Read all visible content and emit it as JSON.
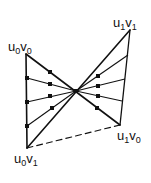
{
  "diagram": {
    "stroke_color": "#111111",
    "vertices": {
      "u0v0": {
        "x": 26,
        "y": 54
      },
      "u0v1": {
        "x": 27,
        "y": 148
      },
      "u1v1": {
        "x": 130,
        "y": 30
      },
      "u1v0": {
        "x": 120,
        "y": 125
      },
      "center": {
        "x": 76,
        "y": 91
      }
    },
    "labels": [
      {
        "id": "u0v0",
        "u": "u",
        "us": "0",
        "v": "v",
        "vs": "0",
        "x": 8,
        "y": 40
      },
      {
        "id": "u1v1",
        "u": "u",
        "us": "1",
        "v": "v",
        "vs": "1",
        "x": 113,
        "y": 16
      },
      {
        "id": "u1v0",
        "u": "u",
        "us": "1",
        "v": "v",
        "vs": "0",
        "x": 117,
        "y": 129
      },
      {
        "id": "u0v1",
        "u": "u",
        "us": "0",
        "v": "v",
        "vs": "1",
        "x": 14,
        "y": 152
      }
    ],
    "edges": [
      {
        "from": [
          26,
          54
        ],
        "to": [
          27,
          148
        ],
        "style": "solid",
        "width": 1.6
      },
      {
        "from": [
          130,
          30
        ],
        "to": [
          120,
          125
        ],
        "style": "solid",
        "width": 1.3
      },
      {
        "from": [
          26,
          54
        ],
        "to": [
          120,
          125
        ],
        "style": "solid",
        "width": 1.6
      },
      {
        "from": [
          27,
          148
        ],
        "to": [
          130,
          30
        ],
        "style": "solid",
        "width": 1.6
      },
      {
        "from": [
          27,
          148
        ],
        "to": [
          120,
          125
        ],
        "style": "dashed",
        "width": 1.1
      }
    ],
    "fan_lines": [
      {
        "from": [
          27,
          78
        ],
        "to": [
          76,
          91
        ]
      },
      {
        "from": [
          27,
          102
        ],
        "to": [
          76,
          91
        ]
      },
      {
        "from": [
          27,
          126
        ],
        "to": [
          76,
          91
        ]
      },
      {
        "from": [
          76,
          91
        ],
        "to": [
          128,
          55
        ]
      },
      {
        "from": [
          76,
          91
        ],
        "to": [
          125,
          79
        ]
      },
      {
        "from": [
          76,
          91
        ],
        "to": [
          122,
          101
        ]
      }
    ],
    "markers": [
      [
        27,
        78
      ],
      [
        27,
        102
      ],
      [
        27,
        126
      ],
      [
        50,
        72
      ],
      [
        50,
        84
      ],
      [
        50,
        96
      ],
      [
        52,
        108
      ],
      [
        98,
        76
      ],
      [
        98,
        86
      ],
      [
        98,
        96
      ],
      [
        97,
        108
      ],
      [
        76,
        91
      ]
    ]
  }
}
